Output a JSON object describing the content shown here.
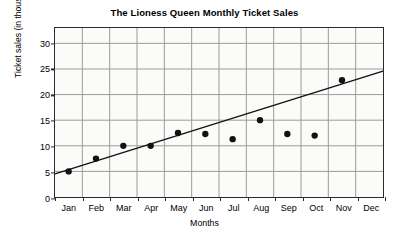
{
  "chart_data": {
    "type": "scatter",
    "title": "The Lioness Queen Monthly Ticket Sales",
    "xlabel": "Months",
    "ylabel": "Ticket sales (in thousands)",
    "categories": [
      "Jan",
      "Feb",
      "Mar",
      "Apr",
      "May",
      "Jun",
      "Jul",
      "Aug",
      "Sep",
      "Oct",
      "Nov",
      "Dec"
    ],
    "values": [
      5,
      7.5,
      10,
      10,
      12.5,
      12.3,
      11.3,
      15,
      12.3,
      12,
      22.8,
      null
    ],
    "ylim": [
      0,
      33
    ],
    "xlim": [
      0,
      12
    ],
    "yticks": [
      0,
      5,
      10,
      15,
      20,
      25,
      30
    ],
    "ytick_labels": [
      "0",
      "5",
      "10",
      "15",
      "20",
      "25",
      "30"
    ],
    "grid": true,
    "legend": "none",
    "marker_color": "#111111",
    "gridline_color": "#9a9a9a",
    "axis_color": "#2b2b2b",
    "plot_background": "#fbfbfa",
    "trendline": {
      "label": "line of best fit",
      "x_start": 0,
      "y_start": 4.5,
      "x_end": 12,
      "y_end": 24.6,
      "color": "#111111"
    }
  }
}
